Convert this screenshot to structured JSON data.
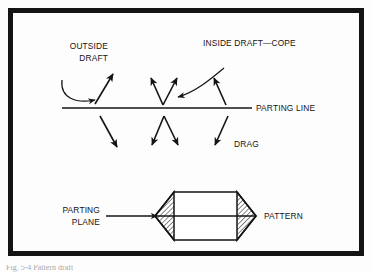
{
  "figure": {
    "background_color": "#fdfdfd",
    "ink_color": "#141414",
    "border": {
      "color": "#141414",
      "thickness_px": 5,
      "inset_px": 8
    },
    "labels": {
      "outside_draft_line1": "OUTSIDE",
      "outside_draft_line2": "DRAFT",
      "inside_draft_cope": "INSIDE DRAFT—COPE",
      "parting_line": "PARTING LINE",
      "drag": "DRAG",
      "parting_plane_line1": "PARTING",
      "parting_plane_line2": "PLANE",
      "pattern": "PATTERN"
    },
    "parting_line": {
      "x_start": 62,
      "x_end": 252,
      "y": 108
    },
    "draft_arrows_cope": [
      {
        "name": "outside-draft-arrow",
        "x1": 95,
        "y1": 104,
        "x2": 113,
        "y2": 74
      },
      {
        "name": "inside-draft-arrow-left",
        "x1": 163,
        "y1": 105,
        "x2": 151,
        "y2": 78
      },
      {
        "name": "inside-draft-arrow-right",
        "x1": 163,
        "y1": 105,
        "x2": 177,
        "y2": 78
      },
      {
        "name": "inside-draft-arrow-far-right",
        "x1": 226,
        "y1": 105,
        "x2": 214,
        "y2": 78
      }
    ],
    "draft_arrows_drag": [
      {
        "name": "drag-arrow-outer-left",
        "x1": 100,
        "y1": 116,
        "x2": 117,
        "y2": 147
      },
      {
        "name": "drag-arrow-inner-left",
        "x1": 164,
        "y1": 116,
        "x2": 152,
        "y2": 145
      },
      {
        "name": "drag-arrow-inner-right",
        "x1": 164,
        "y1": 116,
        "x2": 178,
        "y2": 145
      },
      {
        "name": "drag-arrow-outer-right",
        "x1": 228,
        "y1": 116,
        "x2": 215,
        "y2": 145
      }
    ],
    "leaders": {
      "outside_draft_curve": "M 62,80 C 60,98 76,104 95,100",
      "inside_draft_curve": "M 224,68 C 212,78 196,92 178,97"
    },
    "parting_plane_pointer": {
      "x1": 106,
      "x2": 157,
      "y": 216
    },
    "pattern": {
      "name": "hexagonal-pattern-cross-section",
      "left_x": 155,
      "right_x": 256,
      "top_y": 192,
      "bottom_y": 240,
      "taper_inset": 19,
      "centerline_y": 216,
      "hatch_angle_deg": 45,
      "hatch_color": "#141414"
    },
    "caption_fragment": "Fig. 5-4  Pattern draft"
  }
}
